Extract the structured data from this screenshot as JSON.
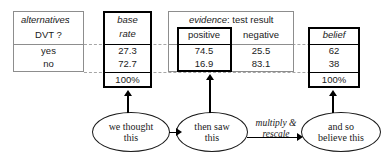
{
  "alternatives_table": {
    "header_label": "alternatives",
    "header_colon": ":",
    "header_question": "DVT ?",
    "rows": [
      "yes",
      "no"
    ]
  },
  "base_rate_box": {
    "header_line1": "base",
    "header_line2": "rate",
    "values": [
      "27.3",
      "72.7"
    ],
    "total": "100%"
  },
  "evidence_table": {
    "header_label": "evidence",
    "header_rest": ": test result",
    "columns": [
      "positive",
      "negative"
    ],
    "positive_values": [
      "74.5",
      "16.9"
    ],
    "negative_values": [
      "25.5",
      "83.1"
    ]
  },
  "belief_box": {
    "header": "belief",
    "values": [
      "62",
      "38"
    ],
    "total": "100%"
  },
  "flow": {
    "node1_line1": "we thought",
    "node1_line2": "this",
    "node2_line1": "then saw",
    "node2_line2": "this",
    "node3_line1": "and so",
    "node3_line2": "believe this",
    "edge_label_line1": "multiply &",
    "edge_label_line2": "rescale"
  },
  "colors": {
    "thin_border": "#8d8d8d",
    "bold_border": "#000000",
    "dashed": "#a6a6a6",
    "text": "#1a1a1a"
  }
}
